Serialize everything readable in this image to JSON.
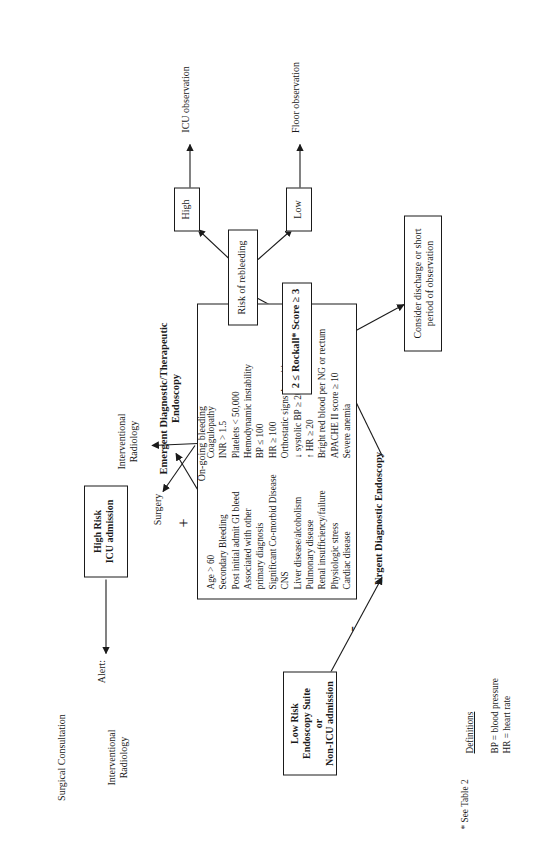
{
  "figure": {
    "orientation": "rotated-90-ccw",
    "ink_color": "#1a1a1a",
    "background": "#ffffff"
  },
  "criteria_box": {
    "left_column": "Age > 60\nSecondary Bleeding\nPost initial admit GI bleed\nAssociated with other\n     primary diagnosis\nSignificant Co-morbid Disease\nCNS\nLiver disease/alcoholism\nPulmonary disease\nRenal insufficiency/failure\nPhysiologic stress\nCardiac disease",
    "right_column": "Coagulopathy\n  INR > 1.5\n  Platelets < 50,000\nHemodynamic instability\n  BP ≤ 100\n  HR ≥ 100\nOrthostatic signs Δ position\n  ↓ systolic BP ≥ 20\n  ↑ HR ≥ 20\nBright red blood per NG or rectum\nAPACHE II score ≥ 10\nSevere anemia"
  },
  "nodes": {
    "low_risk": "Low Risk\nEndoscopy Suite\nor\nNon-ICU admission",
    "high_risk": "High Risk\nICU admission",
    "urgent_endoscopy": "Urgent Diagnostic Endoscopy",
    "emergent_endoscopy": "Emergent Diagnostic/Therapeutic\nEndoscopy",
    "rockall": "2 ≤ Rockall* Score ≥ 3",
    "consider_discharge": "Consider discharge or short\nperiod of observation",
    "ongoing_bleeding": "On-going bleeding",
    "risk_of_rebleeding": "Risk of rebleeding",
    "high": "High",
    "low": "Low",
    "surgery": "Surgery",
    "interventional_radiology_mid": "Interventional\nRadiology",
    "icu_observation": "ICU observation",
    "floor_observation": "Floor observation",
    "alert": "Alert:",
    "surgical_consultation": "Surgical Consultation",
    "interventional_radiology_top": "Interventional\nRadiology"
  },
  "edge_labels": {
    "plus": "+",
    "minus": "-"
  },
  "definitions": {
    "title": "Definitions",
    "lines": "BP = blood pressure\nHR = heart rate"
  },
  "footnote": "* See Table 2"
}
